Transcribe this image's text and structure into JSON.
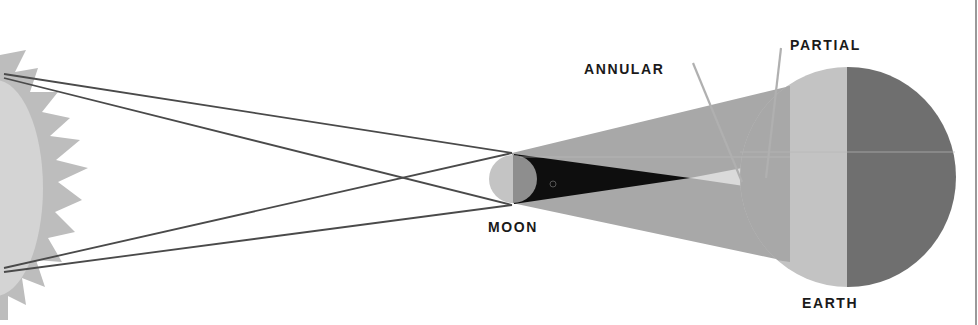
{
  "diagram": {
    "type": "solar-eclipse-geometry",
    "bodies": [
      {
        "name": "sun",
        "label": "",
        "color_disk": "#d2d2d2",
        "color_corona": "#bcbcbc"
      },
      {
        "name": "moon",
        "label": "MOON",
        "color_lit": "#c4c4c4",
        "color_dark": "#8e8e8e"
      },
      {
        "name": "earth",
        "label": "EARTH",
        "color_lit": "#c2c2c2",
        "color_dark": "#6e6e6e"
      }
    ],
    "shadow_regions": [
      {
        "name": "penumbra",
        "color": "#a6a6a6"
      },
      {
        "name": "umbra",
        "color": "#0d0d0d"
      },
      {
        "name": "antumbra",
        "color": "#d9d9d9"
      }
    ],
    "annotations": [
      {
        "name": "annular",
        "label": "ANNULAR"
      },
      {
        "name": "partial",
        "label": "PARTIAL"
      }
    ],
    "colors": {
      "background": "#ffffff",
      "ray_lines": "#4a4a4a",
      "pointer_lines": "#b5b5b5",
      "label_text": "#1a1a1a"
    }
  }
}
